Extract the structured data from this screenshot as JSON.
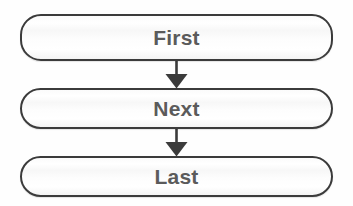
{
  "diagram": {
    "type": "flowchart",
    "orientation": "vertical",
    "background_color": "#ffffff",
    "node_border_color": "#3b3b3b",
    "node_fill_color": "#fbfbfb",
    "label_color": "#5b5b5b",
    "arrow_color": "#3b3b3b",
    "nodes": [
      {
        "id": "first",
        "label": "First",
        "shape": "rounded-rectangle"
      },
      {
        "id": "next",
        "label": "Next",
        "shape": "rounded-rectangle"
      },
      {
        "id": "last",
        "label": "Last",
        "shape": "rounded-rectangle"
      }
    ],
    "edges": [
      {
        "from": "first",
        "to": "next",
        "style": "solid",
        "arrowhead": "filled-triangle"
      },
      {
        "from": "next",
        "to": "last",
        "style": "solid",
        "arrowhead": "filled-triangle"
      }
    ]
  }
}
